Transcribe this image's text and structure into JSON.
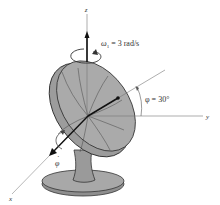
{
  "figure": {
    "axes": {
      "x_label": "x",
      "y_label": "y",
      "z_label": "z"
    },
    "angular_velocity": {
      "symbol": "ω",
      "subscript": "1",
      "text": " = 3 rad/s"
    },
    "tilt_angle": {
      "text": "φ = 30°"
    },
    "tilt_rate": {
      "symbol": "φ",
      "dot": "·"
    },
    "colors": {
      "dish_fill": "#a6a6a6",
      "dish_inner": "#b8b8b8",
      "line": "#333333",
      "axis": "#777777"
    }
  }
}
